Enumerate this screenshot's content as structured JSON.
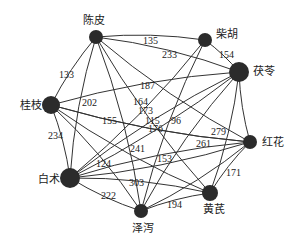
{
  "diagram": {
    "type": "network",
    "nodes": [
      {
        "id": "chenpi",
        "label": "陈皮",
        "x": 96,
        "y": 37,
        "r": 7,
        "label_x": 83,
        "label_y": 24
      },
      {
        "id": "chaihu",
        "label": "柴胡",
        "x": 205,
        "y": 40,
        "r": 7,
        "label_x": 216,
        "label_y": 38
      },
      {
        "id": "fuling",
        "label": "茯苓",
        "x": 239,
        "y": 72,
        "r": 10,
        "label_x": 253,
        "label_y": 75
      },
      {
        "id": "guizhi",
        "label": "桂枝",
        "x": 51,
        "y": 105,
        "r": 9,
        "label_x": 20,
        "label_y": 109
      },
      {
        "id": "honghua",
        "label": "红花",
        "x": 250,
        "y": 142,
        "r": 7,
        "label_x": 262,
        "label_y": 146
      },
      {
        "id": "baizhu",
        "label": "白术",
        "x": 70,
        "y": 178,
        "r": 10,
        "label_x": 38,
        "label_y": 183
      },
      {
        "id": "huangqi",
        "label": "黄芪",
        "x": 210,
        "y": 193,
        "r": 8,
        "label_x": 203,
        "label_y": 213
      },
      {
        "id": "zexie",
        "label": "泽泻",
        "x": 141,
        "y": 211,
        "r": 7,
        "label_x": 132,
        "label_y": 232
      }
    ],
    "edges": [
      {
        "source": "chenpi",
        "target": "chaihu",
        "weight": "135",
        "lx": 143,
        "ly": 44
      },
      {
        "source": "chenpi",
        "target": "guizhi",
        "weight": "133",
        "lx": 59,
        "ly": 78
      },
      {
        "source": "chenpi",
        "target": "fuling",
        "weight": "233",
        "lx": 162,
        "ly": 58
      },
      {
        "source": "chenpi",
        "target": "huangqi",
        "weight": "173",
        "lx": 138,
        "ly": 114
      },
      {
        "source": "chenpi",
        "target": "zexie",
        "weight": "",
        "lx": 0,
        "ly": 0
      },
      {
        "source": "chenpi",
        "target": "baizhu",
        "weight": "",
        "lx": 0,
        "ly": 0
      },
      {
        "source": "chaihu",
        "target": "fuling",
        "weight": "154",
        "lx": 219,
        "ly": 58
      },
      {
        "source": "chaihu",
        "target": "zexie",
        "weight": "96",
        "lx": 171,
        "ly": 124
      },
      {
        "source": "chaihu",
        "target": "baizhu",
        "weight": "164",
        "lx": 133,
        "ly": 105
      },
      {
        "source": "fuling",
        "target": "guizhi",
        "weight": "187",
        "lx": 140,
        "ly": 89
      },
      {
        "source": "fuling",
        "target": "huangqi",
        "weight": "",
        "lx": 0,
        "ly": 0
      },
      {
        "source": "fuling",
        "target": "zexie",
        "weight": "",
        "lx": 0,
        "ly": 0
      },
      {
        "source": "fuling",
        "target": "baizhu",
        "weight": "115",
        "lx": 145,
        "ly": 124
      },
      {
        "source": "guizhi",
        "target": "honghua",
        "weight": "176",
        "lx": 148,
        "ly": 132
      },
      {
        "source": "guizhi",
        "target": "baizhu",
        "weight": "234",
        "lx": 48,
        "ly": 139
      },
      {
        "source": "guizhi",
        "target": "huangqi",
        "weight": "155",
        "lx": 102,
        "ly": 124
      },
      {
        "source": "guizhi",
        "target": "zexie",
        "weight": "",
        "lx": 0,
        "ly": 0
      },
      {
        "source": "guizhi",
        "target": "honghua2",
        "weight": "202",
        "lx": 82,
        "ly": 106
      },
      {
        "source": "honghua",
        "target": "fuling",
        "weight": "",
        "lx": 0,
        "ly": 0
      },
      {
        "source": "honghua",
        "target": "baizhu",
        "weight": "261",
        "lx": 196,
        "ly": 147
      },
      {
        "source": "honghua",
        "target": "chenpi",
        "weight": "279",
        "lx": 211,
        "ly": 135
      },
      {
        "source": "honghua",
        "target": "huangqi",
        "weight": "171",
        "lx": 226,
        "ly": 176
      },
      {
        "source": "baizhu",
        "target": "huangqi",
        "weight": "241",
        "lx": 130,
        "ly": 152
      },
      {
        "source": "baizhu",
        "target": "zexie",
        "weight": "222",
        "lx": 101,
        "ly": 199
      },
      {
        "source": "baizhu",
        "target": "fuling2",
        "weight": "124",
        "lx": 96,
        "ly": 167
      },
      {
        "source": "baizhu",
        "target": "honghua3",
        "weight": "303",
        "lx": 129,
        "ly": 186
      },
      {
        "source": "zexie",
        "target": "huangqi",
        "weight": "194",
        "lx": 167,
        "ly": 208
      },
      {
        "source": "zexie",
        "target": "honghua4",
        "weight": "153",
        "lx": 157,
        "ly": 162
      }
    ]
  }
}
